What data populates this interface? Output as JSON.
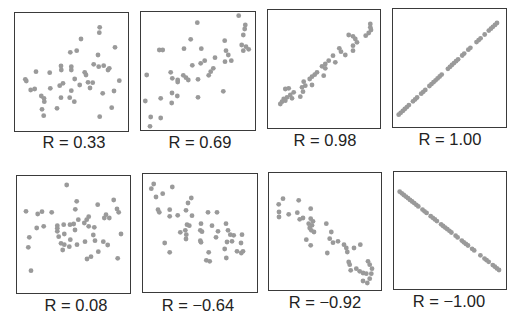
{
  "figure": {
    "title": "",
    "dot_color": "#9a9a9a",
    "border_color": "#3a3a3a"
  },
  "chart_data": [
    {
      "type": "scatter",
      "label": "R = 0.33",
      "r": 0.33,
      "box": [
        14,
        12,
        129,
        132
      ],
      "points": [
        [
          99.7,
          27.3
        ],
        [
          99.3,
          32.7
        ],
        [
          81,
          39
        ],
        [
          115,
          47.3
        ],
        [
          70.3,
          52.3
        ],
        [
          76.7,
          50.7
        ],
        [
          98,
          55
        ],
        [
          93.7,
          64.3
        ],
        [
          98.7,
          66.7
        ],
        [
          103.7,
          65.7
        ],
        [
          109.3,
          68.3
        ],
        [
          108,
          70
        ],
        [
          61,
          66
        ],
        [
          61.3,
          70
        ],
        [
          71.3,
          66.7
        ],
        [
          71.3,
          70
        ],
        [
          36,
          71.7
        ],
        [
          49.7,
          72.7
        ],
        [
          84.7,
          72.3
        ],
        [
          86,
          75
        ],
        [
          25.3,
          79.3
        ],
        [
          26.3,
          81
        ],
        [
          74.7,
          79
        ],
        [
          88,
          82.3
        ],
        [
          92.7,
          82.7
        ],
        [
          119.3,
          80.7
        ],
        [
          63,
          83.3
        ],
        [
          59.7,
          85.7
        ],
        [
          79.7,
          85
        ],
        [
          90,
          88
        ],
        [
          30.7,
          90
        ],
        [
          34.7,
          89
        ],
        [
          50.3,
          88.3
        ],
        [
          71.3,
          90.7
        ],
        [
          102.7,
          93.3
        ],
        [
          114,
          91
        ],
        [
          41.3,
          96
        ],
        [
          44,
          98.3
        ],
        [
          44.3,
          101.7
        ],
        [
          61,
          97.7
        ],
        [
          69.7,
          97.7
        ],
        [
          74.3,
          101.7
        ],
        [
          42,
          109.3
        ],
        [
          57,
          108.3
        ],
        [
          111.7,
          107.7
        ],
        [
          43.7,
          115.7
        ],
        [
          99.7,
          116.7
        ]
      ]
    },
    {
      "type": "scatter",
      "label": "R = 0.69",
      "r": 0.69,
      "box": [
        140,
        11,
        256,
        131
      ],
      "points": [
        [
          238.7,
          15.7
        ],
        [
          197.3,
          22.7
        ],
        [
          245.3,
          25
        ],
        [
          244.7,
          29
        ],
        [
          243.3,
          35
        ],
        [
          190.7,
          39.3
        ],
        [
          224.7,
          40.7
        ],
        [
          241.7,
          45
        ],
        [
          246,
          46.7
        ],
        [
          248.7,
          49.3
        ],
        [
          243.3,
          50.7
        ],
        [
          159.3,
          50
        ],
        [
          162.7,
          50
        ],
        [
          184,
          48.7
        ],
        [
          201.3,
          48.7
        ],
        [
          226,
          50.7
        ],
        [
          228.3,
          55
        ],
        [
          215,
          57.7
        ],
        [
          225,
          61.7
        ],
        [
          231.3,
          60.7
        ],
        [
          204.7,
          60.7
        ],
        [
          200.7,
          63.3
        ],
        [
          192.3,
          65.3
        ],
        [
          213.3,
          68.3
        ],
        [
          210.7,
          71.7
        ],
        [
          208.7,
          75.3
        ],
        [
          170.7,
          72.3
        ],
        [
          146.7,
          75
        ],
        [
          183.3,
          75.3
        ],
        [
          186,
          77.7
        ],
        [
          188.3,
          80
        ],
        [
          172.3,
          78.3
        ],
        [
          177.7,
          80
        ],
        [
          177.7,
          82
        ],
        [
          198,
          79.3
        ],
        [
          223.3,
          91.3
        ],
        [
          172,
          93
        ],
        [
          177.3,
          96
        ],
        [
          160.7,
          98.3
        ],
        [
          198,
          97.3
        ],
        [
          145.3,
          101
        ],
        [
          171.7,
          103
        ],
        [
          150.7,
          117
        ],
        [
          160.7,
          118
        ],
        [
          150,
          126.3
        ]
      ]
    },
    {
      "type": "scatter",
      "label": "R = 0.98",
      "r": 0.98,
      "box": [
        267,
        9,
        381,
        129
      ],
      "points": [
        [
          370.3,
          24
        ],
        [
          370.3,
          27.3
        ],
        [
          371,
          30
        ],
        [
          368.7,
          33
        ],
        [
          365.7,
          35.7
        ],
        [
          348.7,
          35
        ],
        [
          353,
          36.3
        ],
        [
          355.3,
          39
        ],
        [
          357,
          42.3
        ],
        [
          353,
          45.7
        ],
        [
          339.3,
          48.3
        ],
        [
          341,
          51.7
        ],
        [
          353,
          50.7
        ],
        [
          345.3,
          55
        ],
        [
          333,
          55.7
        ],
        [
          335.3,
          62.3
        ],
        [
          328.7,
          60.7
        ],
        [
          325.3,
          64
        ],
        [
          322,
          66.3
        ],
        [
          325.3,
          68.3
        ],
        [
          317,
          72.3
        ],
        [
          314.7,
          74.7
        ],
        [
          312,
          76.7
        ],
        [
          309.7,
          79
        ],
        [
          323.7,
          75.7
        ],
        [
          303.7,
          81.7
        ],
        [
          305.3,
          85.7
        ],
        [
          302,
          87.3
        ],
        [
          312,
          85
        ],
        [
          288.7,
          88.3
        ],
        [
          285.3,
          89
        ],
        [
          293.7,
          92.3
        ],
        [
          290.3,
          95
        ],
        [
          287,
          97.3
        ],
        [
          283.7,
          99
        ],
        [
          282,
          101.7
        ],
        [
          280.3,
          104
        ],
        [
          285.3,
          100.7
        ],
        [
          292,
          98.3
        ],
        [
          300.3,
          96.7
        ],
        [
          303,
          91.7
        ]
      ]
    },
    {
      "type": "scatter",
      "label": "R = 1.00",
      "r": 1.0,
      "box": [
        392,
        8,
        507,
        128
      ],
      "line": {
        "from": [
          398.7,
          114.7
        ],
        "to": [
          497,
          23
        ],
        "n": 48,
        "gaps": [
          0.12,
          0.2,
          0.3,
          0.47,
          0.62,
          0.68,
          0.76,
          0.86,
          0.9
        ]
      }
    },
    {
      "type": "scatter",
      "label": "R = 0.08",
      "r": 0.08,
      "box": [
        16,
        175,
        131,
        294
      ],
      "points": [
        [
          66.7,
          185
        ],
        [
          76.7,
          201.3
        ],
        [
          113.7,
          200
        ],
        [
          97.7,
          204.7
        ],
        [
          75.3,
          209.3
        ],
        [
          117,
          209
        ],
        [
          118.7,
          212.3
        ],
        [
          26,
          211.3
        ],
        [
          37.7,
          214
        ],
        [
          42,
          211.7
        ],
        [
          51.7,
          212.3
        ],
        [
          106,
          214.7
        ],
        [
          104.3,
          218
        ],
        [
          109.3,
          218
        ],
        [
          78.3,
          219.7
        ],
        [
          88.7,
          216.7
        ],
        [
          86.7,
          219.7
        ],
        [
          84.3,
          223
        ],
        [
          63.7,
          224.7
        ],
        [
          70,
          224.7
        ],
        [
          73.7,
          224
        ],
        [
          57.3,
          225.7
        ],
        [
          57.3,
          228.3
        ],
        [
          57.3,
          231.3
        ],
        [
          36.7,
          228
        ],
        [
          43.7,
          226.3
        ],
        [
          88.7,
          226.3
        ],
        [
          94.3,
          227.3
        ],
        [
          75,
          230
        ],
        [
          64.3,
          234
        ],
        [
          58.7,
          236.7
        ],
        [
          93.3,
          235
        ],
        [
          121,
          234
        ],
        [
          29.3,
          237.3
        ],
        [
          70.3,
          239.7
        ],
        [
          95,
          240.7
        ],
        [
          85,
          241.7
        ],
        [
          103.3,
          241.7
        ],
        [
          107.7,
          245
        ],
        [
          61,
          243.3
        ],
        [
          64.3,
          244.7
        ],
        [
          69.3,
          246.7
        ],
        [
          77,
          244.7
        ],
        [
          28.3,
          247.3
        ],
        [
          62.7,
          250
        ],
        [
          98.3,
          251.7
        ],
        [
          91,
          256.7
        ],
        [
          87,
          259
        ],
        [
          117.7,
          258.3
        ],
        [
          31,
          270.7
        ]
      ]
    },
    {
      "type": "scatter",
      "label": "R = −0.64",
      "r": -0.64,
      "box": [
        142,
        173,
        258,
        293
      ],
      "points": [
        [
          153.7,
          184
        ],
        [
          151.3,
          188.7
        ],
        [
          172.3,
          187
        ],
        [
          156,
          197
        ],
        [
          162.7,
          193.7
        ],
        [
          191.3,
          198
        ],
        [
          188,
          203
        ],
        [
          158,
          209.7
        ],
        [
          159.3,
          212.3
        ],
        [
          169.7,
          209.7
        ],
        [
          186,
          210.3
        ],
        [
          169.7,
          216.3
        ],
        [
          177.7,
          215.3
        ],
        [
          192,
          215.7
        ],
        [
          208,
          212.3
        ],
        [
          217,
          212.3
        ],
        [
          187,
          224.7
        ],
        [
          189.3,
          225.7
        ],
        [
          201,
          223.7
        ],
        [
          212,
          225.7
        ],
        [
          226,
          223.7
        ],
        [
          185.3,
          230.3
        ],
        [
          200.3,
          230.3
        ],
        [
          202,
          231.7
        ],
        [
          180.3,
          232.3
        ],
        [
          186.3,
          234.7
        ],
        [
          218,
          231.3
        ],
        [
          228,
          230.3
        ],
        [
          230.3,
          234.7
        ],
        [
          233.7,
          235.3
        ],
        [
          242,
          234.7
        ],
        [
          216,
          237.3
        ],
        [
          186,
          239
        ],
        [
          200.3,
          240.7
        ],
        [
          201,
          242.3
        ],
        [
          227,
          242
        ],
        [
          232,
          241.3
        ],
        [
          241,
          243
        ],
        [
          164.7,
          243
        ],
        [
          224.7,
          249
        ],
        [
          237,
          251.3
        ],
        [
          241.3,
          253
        ],
        [
          243,
          251.3
        ],
        [
          169.7,
          252.3
        ],
        [
          208.7,
          252.3
        ],
        [
          226.3,
          258
        ],
        [
          206.3,
          260.3
        ],
        [
          209.7,
          261.3
        ]
      ]
    },
    {
      "type": "scatter",
      "label": "R = −0.92",
      "r": -0.92,
      "box": [
        268,
        172,
        382,
        291
      ],
      "points": [
        [
          283,
          198.7
        ],
        [
          278.7,
          204.3
        ],
        [
          298.7,
          200.3
        ],
        [
          279,
          212
        ],
        [
          279,
          217
        ],
        [
          288.7,
          214.3
        ],
        [
          297.3,
          212.7
        ],
        [
          310.7,
          208.7
        ],
        [
          299.7,
          219.3
        ],
        [
          303,
          218
        ],
        [
          310.7,
          218.7
        ],
        [
          313,
          221.3
        ],
        [
          308.7,
          223.7
        ],
        [
          312,
          225.3
        ],
        [
          309.7,
          228
        ],
        [
          326.3,
          223.7
        ],
        [
          311.3,
          230.3
        ],
        [
          314,
          232
        ],
        [
          331.3,
          232
        ],
        [
          329.7,
          238.7
        ],
        [
          306.3,
          239.7
        ],
        [
          333,
          242.7
        ],
        [
          338,
          241.3
        ],
        [
          310.7,
          245.3
        ],
        [
          344,
          244.7
        ],
        [
          346.3,
          248
        ],
        [
          347.3,
          252
        ],
        [
          354,
          248
        ],
        [
          360.3,
          244.7
        ],
        [
          327.3,
          253
        ],
        [
          348.7,
          262
        ],
        [
          349.7,
          264.7
        ],
        [
          368,
          261.3
        ],
        [
          369.7,
          264.7
        ],
        [
          372,
          268.7
        ],
        [
          356.3,
          268.7
        ],
        [
          359.7,
          271.3
        ],
        [
          363,
          273
        ],
        [
          366.3,
          273.7
        ],
        [
          371.3,
          273.7
        ],
        [
          350.7,
          270.3
        ],
        [
          369.7,
          278.7
        ],
        [
          363,
          281
        ],
        [
          367.3,
          283
        ]
      ]
    },
    {
      "type": "scatter",
      "label": "R = −1.00",
      "r": -1.0,
      "box": [
        393,
        171,
        507,
        290
      ],
      "line": {
        "from": [
          399.7,
          191.7
        ],
        "to": [
          499,
          270
        ],
        "n": 48,
        "gaps": [
          0.21,
          0.3,
          0.4,
          0.55,
          0.6,
          0.7,
          0.78,
          0.83,
          0.91
        ]
      }
    }
  ]
}
